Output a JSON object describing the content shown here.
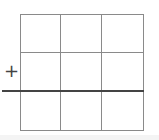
{
  "diagram": {
    "type": "grid",
    "rows": 3,
    "cols": 3,
    "marker_symbol": "+",
    "line_color": "#8a8a8a",
    "axis_color": "#444444"
  }
}
